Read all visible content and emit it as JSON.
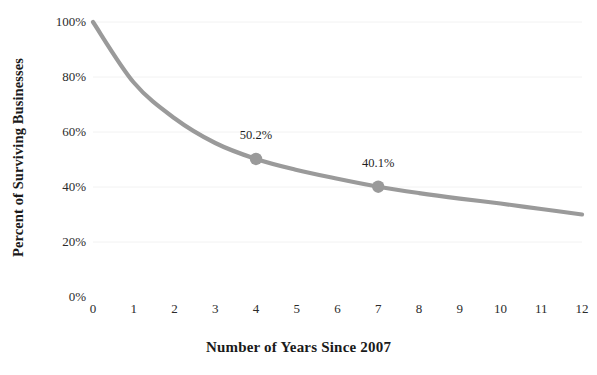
{
  "chart_data": {
    "type": "line",
    "title": "",
    "xlabel": "Number of Years Since 2007",
    "ylabel": "Percent of Surviving Businesses",
    "x": [
      0,
      1,
      2,
      3,
      4,
      5,
      6,
      7,
      8,
      9,
      10,
      11,
      12
    ],
    "xtick_labels": [
      "0",
      "1",
      "2",
      "3",
      "4",
      "5",
      "6",
      "7",
      "8",
      "9",
      "10",
      "11",
      "12"
    ],
    "ytick_labels": [
      "0%",
      "20%",
      "40%",
      "60%",
      "80%",
      "100%"
    ],
    "ytick_values": [
      0,
      20,
      40,
      60,
      80,
      100
    ],
    "values": [
      100.0,
      78.0,
      65.0,
      56.0,
      50.2,
      46.2,
      43.0,
      40.1,
      37.8,
      35.8,
      34.0,
      32.0,
      30.0
    ],
    "xlim": [
      0,
      12
    ],
    "ylim": [
      0,
      100
    ],
    "grid": true,
    "legend": "none",
    "series_color": "#9a9a9a",
    "grid_color": "#f2f2f2",
    "text_color": "#1a1a1a",
    "annotations": [
      {
        "x": 4,
        "y": 50.2,
        "label": "50.2%",
        "marker": true
      },
      {
        "x": 7,
        "y": 40.1,
        "label": "40.1%",
        "marker": true
      }
    ]
  }
}
